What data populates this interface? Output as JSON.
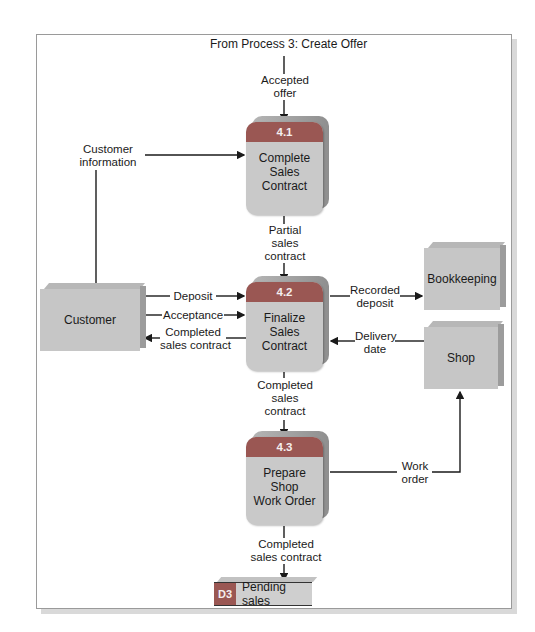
{
  "diagram": {
    "type": "data-flow-diagram",
    "source_label": "From Process 3: Create Offer",
    "colors": {
      "process_header": "#9a5753",
      "process_body": "#c9c9c9",
      "entity_face": "#c6c6c6",
      "frame_border": "#9a9a9a",
      "line": "#1a1a1a"
    },
    "processes": [
      {
        "id": "4.1",
        "name": "Complete\nSales\nContract"
      },
      {
        "id": "4.2",
        "name": "Finalize\nSales\nContract"
      },
      {
        "id": "4.3",
        "name": "Prepare\nShop\nWork Order"
      }
    ],
    "entities": [
      {
        "name": "Customer"
      },
      {
        "name": "Bookkeeping"
      },
      {
        "name": "Shop"
      }
    ],
    "data_store": {
      "id": "D3",
      "name": "Pending sales"
    },
    "flows": [
      {
        "label": "Accepted\noffer",
        "from": "From Process 3",
        "to": "4.1"
      },
      {
        "label": "Customer\ninformation",
        "from": "Customer",
        "to": "4.1"
      },
      {
        "label": "Partial\nsales\ncontract",
        "from": "4.1",
        "to": "4.2"
      },
      {
        "label": "Deposit",
        "from": "Customer",
        "to": "4.2"
      },
      {
        "label": "Acceptance",
        "from": "Customer",
        "to": "4.2"
      },
      {
        "label": "Completed\nsales contract",
        "from": "4.2",
        "to": "Customer"
      },
      {
        "label": "Recorded\ndeposit",
        "from": "4.2",
        "to": "Bookkeeping"
      },
      {
        "label": "Delivery\ndate",
        "from": "Shop",
        "to": "4.2"
      },
      {
        "label": "Completed\nsales\ncontract",
        "from": "4.2",
        "to": "4.3"
      },
      {
        "label": "Work\norder",
        "from": "4.3",
        "to": "Shop"
      },
      {
        "label": "Completed\nsales contract",
        "from": "4.3",
        "to": "D3"
      }
    ]
  }
}
